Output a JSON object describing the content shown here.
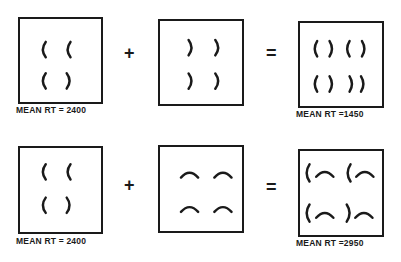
{
  "rows": [
    {
      "left": {
        "label": "MEAN RT = 2400",
        "glyphs": [
          "(",
          "(",
          "(",
          ")"
        ]
      },
      "operator": "+",
      "middle": {
        "glyphs": [
          ")",
          ")",
          ")",
          ")"
        ]
      },
      "equals": "=",
      "right": {
        "label": "MEAN RT =1450",
        "glyphs": [
          "()",
          "()",
          "()",
          "))"
        ]
      }
    },
    {
      "left": {
        "label": "MEAN RT = 2400",
        "glyphs": [
          "(",
          "(",
          "(",
          ")"
        ]
      },
      "operator": "+",
      "middle": {
        "glyphs": [
          "arc",
          "arc",
          "arc",
          "arc"
        ]
      },
      "equals": "=",
      "right": {
        "label": "MEAN RT =2950",
        "glyphs": [
          "(arc",
          "(arc",
          "(arc",
          ")arc"
        ]
      }
    }
  ],
  "colors": {
    "ink": "#1a1a1a",
    "background": "#ffffff"
  }
}
